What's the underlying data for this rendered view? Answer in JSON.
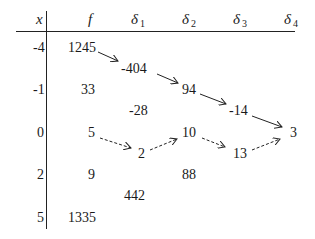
{
  "table": {
    "headers": {
      "x": "x",
      "f": "f",
      "d1": {
        "sym": "δ",
        "sub": "1"
      },
      "d2": {
        "sym": "δ",
        "sub": "2"
      },
      "d3": {
        "sym": "δ",
        "sub": "3"
      },
      "d4": {
        "sym": "δ",
        "sub": "4"
      }
    },
    "x_values": [
      "-4",
      "-1",
      "0",
      "2",
      "5"
    ],
    "f_values": [
      "1245",
      "33",
      "5",
      "9",
      "1335"
    ],
    "delta1": [
      "-404",
      "-28",
      "2",
      "442"
    ],
    "delta2": [
      "94",
      "10",
      "88"
    ],
    "delta3": [
      "-14",
      "13"
    ],
    "delta4": [
      "3"
    ]
  },
  "arrows": {
    "solid_path": [
      "1245",
      "-404",
      "94",
      "-14",
      "3"
    ],
    "dashed_path": [
      "5",
      "2",
      "10",
      "13",
      "3"
    ]
  }
}
